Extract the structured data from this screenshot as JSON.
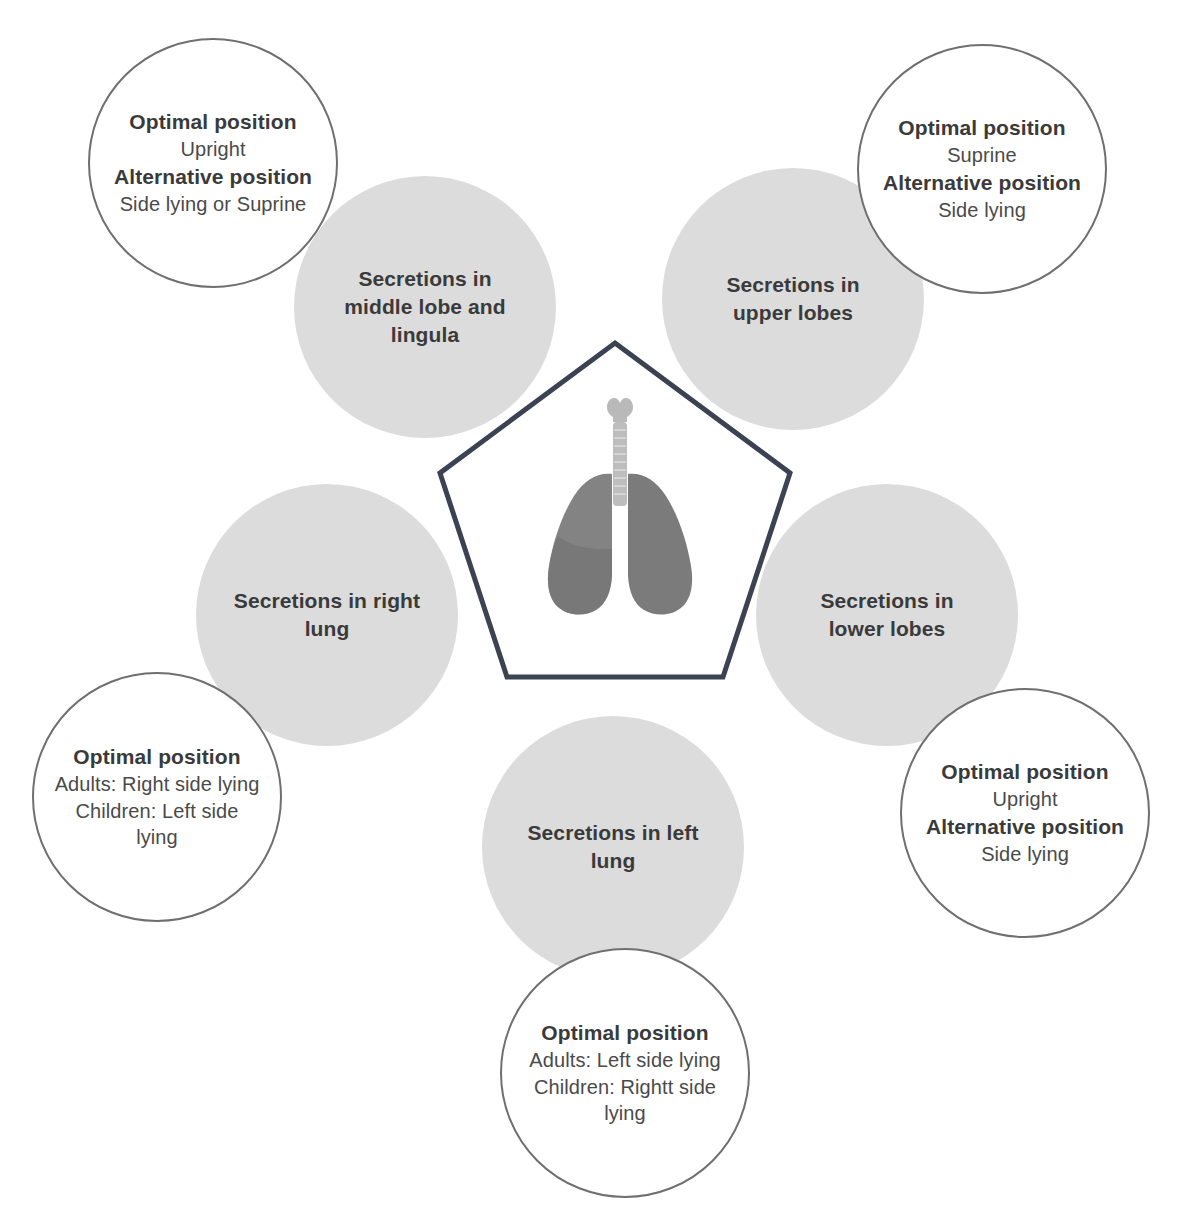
{
  "diagram": {
    "center": {
      "shape": "pentagon",
      "icon": "lungs-icon",
      "outline_color": "#3b4252",
      "lung_color": "#808080",
      "lung_shadow_color": "#6e6e6e",
      "trachea_color": "#b5b5b5"
    },
    "colors": {
      "grey_bubble_fill": "#dcdcdc",
      "white_bubble_fill": "#ffffff",
      "white_bubble_stroke": "#6f6f6f",
      "heading_text": "#3a3a3a",
      "value_text": "#4a4a4a",
      "background": "#ffffff"
    }
  },
  "conditions": [
    {
      "id": "middle-lobe-lingula",
      "label": "Secretions in middle lobe and lingula"
    },
    {
      "id": "upper-lobes",
      "label": "Secretions in upper lobes"
    },
    {
      "id": "right-lung",
      "label": "Secretions in right lung"
    },
    {
      "id": "lower-lobes",
      "label": "Secretions in lower lobes"
    },
    {
      "id": "left-lung",
      "label": "Secretions in left lung"
    }
  ],
  "positions": [
    {
      "id": "middle-lobe-lingula-position",
      "optimal_heading": "Optimal position",
      "optimal_value": "Upright",
      "alternative_heading": "Alternative position",
      "alternative_value": "Side lying or Suprine"
    },
    {
      "id": "upper-lobes-position",
      "optimal_heading": "Optimal position",
      "optimal_value": "Suprine",
      "alternative_heading": "Alternative position",
      "alternative_value": "Side lying"
    },
    {
      "id": "right-lung-position",
      "optimal_heading": "Optimal position",
      "adults_value": "Adults: Right side lying",
      "children_value_line1": "Children: Left side",
      "children_value_line2": "lying"
    },
    {
      "id": "lower-lobes-position",
      "optimal_heading": "Optimal position",
      "optimal_value": "Upright",
      "alternative_heading": "Alternative position",
      "alternative_value": "Side lying"
    },
    {
      "id": "left-lung-position",
      "optimal_heading": "Optimal position",
      "adults_value": "Adults: Left side lying",
      "children_value_line1": "Children: Rightt side",
      "children_value_line2": "lying"
    }
  ]
}
